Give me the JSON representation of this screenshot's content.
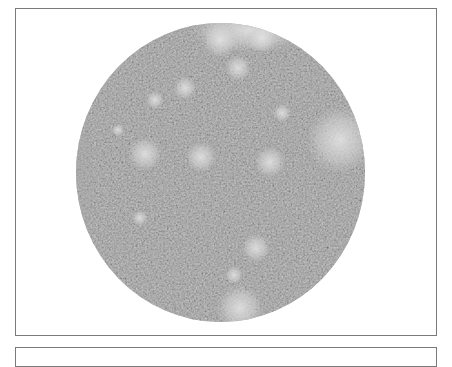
{
  "image": {
    "description": "Circular grayscale micrograph of cell culture with scattered bright colonies",
    "shape": "circle",
    "colors": {
      "frame_border": "#7a7a7a",
      "background": "#ffffff",
      "base_gray": "#8c8c8c",
      "bright_patch": "#d8d8d8"
    },
    "bright_patches": [
      {
        "cx": 145,
        "cy": 154,
        "r": 13
      },
      {
        "cx": 201,
        "cy": 157,
        "r": 12
      },
      {
        "cx": 270,
        "cy": 162,
        "r": 12
      },
      {
        "cx": 340,
        "cy": 140,
        "r": 26
      },
      {
        "cx": 238,
        "cy": 68,
        "r": 10
      },
      {
        "cx": 220,
        "cy": 40,
        "r": 14
      },
      {
        "cx": 262,
        "cy": 38,
        "r": 12
      },
      {
        "cx": 185,
        "cy": 88,
        "r": 9
      },
      {
        "cx": 155,
        "cy": 100,
        "r": 7
      },
      {
        "cx": 282,
        "cy": 113,
        "r": 7
      },
      {
        "cx": 256,
        "cy": 248,
        "r": 11
      },
      {
        "cx": 234,
        "cy": 275,
        "r": 7
      },
      {
        "cx": 240,
        "cy": 308,
        "r": 18
      },
      {
        "cx": 140,
        "cy": 218,
        "r": 6
      },
      {
        "cx": 118,
        "cy": 130,
        "r": 5
      }
    ]
  }
}
